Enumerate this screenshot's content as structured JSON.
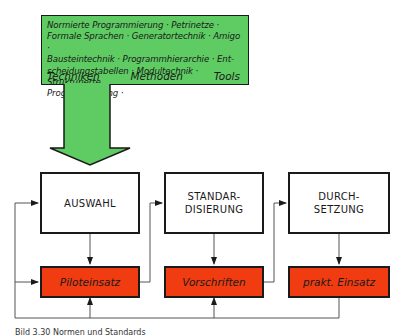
{
  "techniques_box": {
    "lines": [
      "Normierte Programmierung · Petrinetze ·",
      "Formale Sprachen · Generatortechnik · Amigo ·",
      "Bausteintechnik · Programmhierarchie · Ent-",
      "scheidungstabellen · Modultechnik · Strukturierte",
      "Programmierung ·"
    ],
    "labels": [
      "Techniken",
      "Methoden",
      "Tools"
    ]
  },
  "stages": [
    {
      "title_lines": [
        "AUSWAHL"
      ],
      "result": "Piloteinsatz"
    },
    {
      "title_lines": [
        "STANDAR-",
        "DISIERUNG"
      ],
      "result": "Vorschriften"
    },
    {
      "title_lines": [
        "DURCH-",
        "SETZUNG"
      ],
      "result": "prakt. Einsatz"
    }
  ],
  "caption": "Bild 3.30 Normen und Standards",
  "colors": {
    "green": "#5fcb63",
    "red": "#f03c10",
    "line": "#555555",
    "border": "#1a1a1a"
  }
}
